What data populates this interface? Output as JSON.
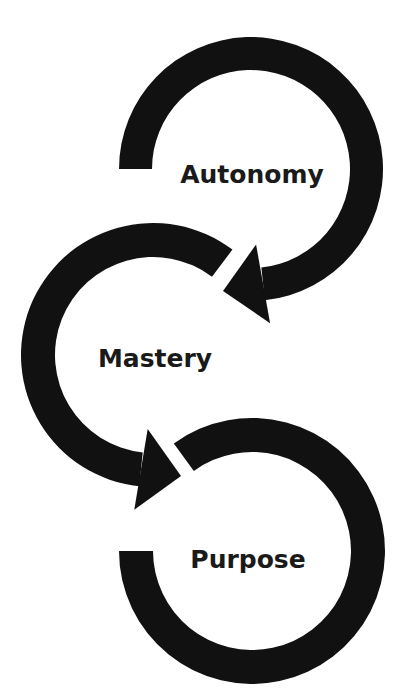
{
  "diagram": {
    "background": "#ffffff",
    "stroke_color": "#111111",
    "text_color": "#1a1a1a",
    "nodes": [
      {
        "id": "autonomy",
        "label": "Autonomy",
        "center": [
          251,
          169
        ],
        "outer_radius": 132,
        "inner_radius": 99,
        "start_angle": 180,
        "end_angle": 444,
        "direction": "clockwise",
        "arrow": {
          "tip": [
            223,
            291
          ],
          "back_half_width": 40
        },
        "label_pos": [
          252,
          183
        ],
        "font_size": 25
      },
      {
        "id": "mastery",
        "label": "Mastery",
        "center": [
          153,
          355
        ],
        "outer_radius": 132,
        "inner_radius": 98,
        "start_angle": 307,
        "end_angle": 96,
        "direction": "counterclockwise",
        "arrow": {
          "tip": [
            181,
            476
          ],
          "back_half_width": 41
        },
        "label_pos": [
          155,
          367
        ],
        "font_size": 25
      },
      {
        "id": "purpose",
        "label": "Purpose",
        "center": [
          252,
          551
        ],
        "outer_radius": 133,
        "inner_radius": 99,
        "start_angle": 234,
        "end_angle": 540,
        "direction": "clockwise",
        "arrow": null,
        "label_pos": [
          248,
          568
        ],
        "font_size": 25
      }
    ],
    "flow": [
      "Autonomy",
      "Mastery",
      "Purpose"
    ]
  }
}
